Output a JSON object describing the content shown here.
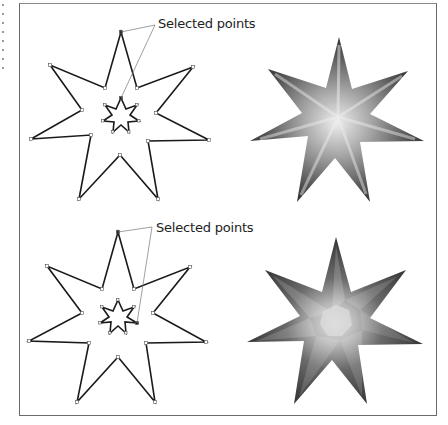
{
  "figure": {
    "panels": [
      {
        "id": "top-left",
        "description": "7-point star outline with small inner star; points selected",
        "callout_label": "Selected points"
      },
      {
        "id": "top-right",
        "description": "7-point star filled with radial-like gradient (dark edges, light center)"
      },
      {
        "id": "bottom-left",
        "description": "7-point star outline with rotated small inner star; points selected",
        "callout_label": "Selected points"
      },
      {
        "id": "bottom-right",
        "description": "7-point star filled with twisted/swirled gradient blend"
      }
    ],
    "colors": {
      "frame": "#6b6b6b",
      "outline": "#1a1a1a",
      "gradient_dark": "#2e2e2e",
      "gradient_light": "#e8e8e8",
      "leader_line": "#777777"
    }
  }
}
